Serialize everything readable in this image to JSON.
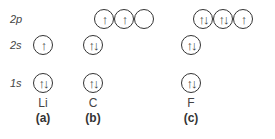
{
  "levels": {
    "p2": "2p",
    "s2": "2s",
    "s1": "1s"
  },
  "arrows": {
    "up": "↑",
    "updown": "↑↓",
    "empty": ""
  },
  "li": {
    "symbol": "Li",
    "label": "(a)",
    "s1": "↑↓",
    "s2": "↑"
  },
  "c": {
    "symbol": "C",
    "label": "(b)",
    "s1": "↑↓",
    "s2": "↑↓",
    "p2": [
      "↑",
      "↑",
      ""
    ]
  },
  "f": {
    "symbol": "F",
    "label": "(c)",
    "s1": "↑↓",
    "s2": "↑↓",
    "p2": [
      "↑↓",
      "↑↓",
      "↑"
    ]
  }
}
